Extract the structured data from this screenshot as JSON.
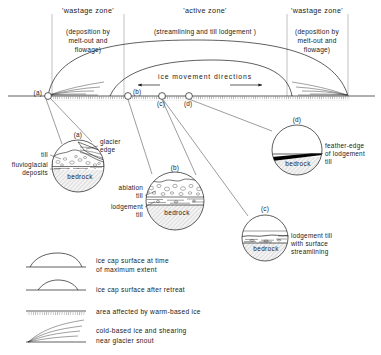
{
  "figure": {
    "type": "cross-section-diagram"
  },
  "zones": [
    {
      "id": "wastage-left",
      "title": "'wastage zone'",
      "subtitle_lines": [
        "(deposition by",
        "melt-out and",
        "flowage)"
      ]
    },
    {
      "id": "active",
      "title": "'active zone'",
      "subtitle_lines": [
        "(streamlining and till lodgement )"
      ]
    },
    {
      "id": "wastage-right",
      "title": "'wastage zone'",
      "subtitle_lines": [
        "(deposition by",
        "melt-out and",
        "flowage)"
      ]
    }
  ],
  "main_section": {
    "movement_label": "ice movement directions",
    "markers": [
      {
        "id": "a",
        "label": "(a)"
      },
      {
        "id": "b",
        "label": "(b)"
      },
      {
        "id": "c",
        "label": "(c)"
      },
      {
        "id": "d",
        "label": "(d)"
      }
    ]
  },
  "insets": [
    {
      "id": "a",
      "label": "(a)",
      "bedrock_label": "bedrock",
      "annotations": [
        {
          "name": "glacier-edge",
          "lines": [
            "glacier",
            "edge"
          ]
        },
        {
          "name": "till",
          "lines": [
            "till"
          ]
        },
        {
          "name": "fluvioglacial-deposits",
          "lines": [
            "fluvioglacial",
            "deposits"
          ]
        }
      ]
    },
    {
      "id": "b",
      "label": "(b)",
      "bedrock_label": "bedrock",
      "annotations": [
        {
          "name": "ablation-till",
          "lines": [
            "ablation",
            "till"
          ]
        },
        {
          "name": "lodgement-till",
          "lines": [
            "lodgement",
            "till"
          ]
        }
      ]
    },
    {
      "id": "c",
      "label": "(c)",
      "bedrock_label": "bedrock",
      "annotations": [
        {
          "name": "lodgement-till-streamlining",
          "lines": [
            "lodgement till",
            "with surface",
            "streamlining"
          ]
        }
      ]
    },
    {
      "id": "d",
      "label": "(d)",
      "bedrock_label": "bedrock",
      "annotations": [
        {
          "name": "feather-edge",
          "lines": [
            "feather-edge",
            "of lodgement",
            "till"
          ]
        }
      ]
    }
  ],
  "legend": {
    "items": [
      {
        "id": "max-extent",
        "symbol": "ice-cap-dome-large",
        "lines": [
          "ice cap surface at time",
          "of maximum extent"
        ]
      },
      {
        "id": "after-retreat",
        "symbol": "ice-cap-dome-small",
        "lines": [
          "ice cap surface after retreat"
        ]
      },
      {
        "id": "warm-based",
        "symbol": "hatched-ground-line",
        "lines": [
          "area affected by warm-based ice"
        ]
      },
      {
        "id": "cold-based",
        "symbol": "shear-fan",
        "lines": [
          "cold-based ice and shearing",
          "near glacier snout"
        ]
      }
    ]
  },
  "colors": {
    "ink": "#1a1a1a",
    "hairline": "#3a3a3a",
    "zone_divider": "#999999",
    "bedrock_fill": "#efefef",
    "till_fill": "#fafafa",
    "feather_edge": "#000000",
    "paper": "#ffffff"
  }
}
